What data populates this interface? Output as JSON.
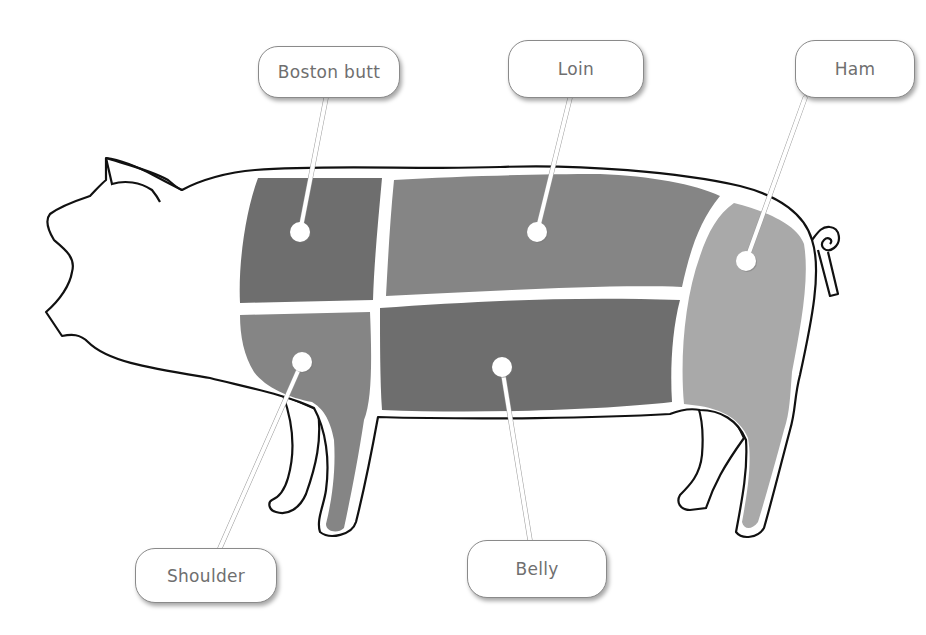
{
  "diagram": {
    "colors": {
      "background": "#ffffff",
      "outline": "#111111",
      "separator": "#ffffff",
      "label_text": "#6f6f6f",
      "label_border": "#8a8a8a",
      "leader_line": "#ffffff",
      "dark_cut": "#6e6e6e",
      "mid_cut": "#858585",
      "light_cut": "#a9a9a9"
    },
    "cuts": [
      {
        "id": "boston-butt",
        "label": "Boston butt",
        "shade": "#6e6e6e",
        "dot": [
          300,
          232
        ],
        "label_box": {
          "x": 258,
          "y": 46,
          "w": 142,
          "h": 52
        },
        "leader_from": [
          326,
          98
        ]
      },
      {
        "id": "loin",
        "label": "Loin",
        "shade": "#858585",
        "dot": [
          537,
          232
        ],
        "label_box": {
          "x": 508,
          "y": 40,
          "w": 136,
          "h": 58
        },
        "leader_from": [
          570,
          98
        ]
      },
      {
        "id": "ham",
        "label": "Ham",
        "shade": "#a9a9a9",
        "dot": [
          746,
          261
        ],
        "label_box": {
          "x": 795,
          "y": 40,
          "w": 120,
          "h": 58
        },
        "leader_from": [
          805,
          98
        ]
      },
      {
        "id": "shoulder",
        "label": "Shoulder",
        "shade": "#858585",
        "dot": [
          302,
          362
        ],
        "label_box": {
          "x": 135,
          "y": 548,
          "w": 142,
          "h": 55
        },
        "leader_from": [
          220,
          548
        ]
      },
      {
        "id": "belly",
        "label": "Belly",
        "shade": "#6e6e6e",
        "dot": [
          502,
          367
        ],
        "label_box": {
          "x": 467,
          "y": 540,
          "w": 140,
          "h": 58
        },
        "leader_from": [
          530,
          540
        ]
      }
    ]
  }
}
